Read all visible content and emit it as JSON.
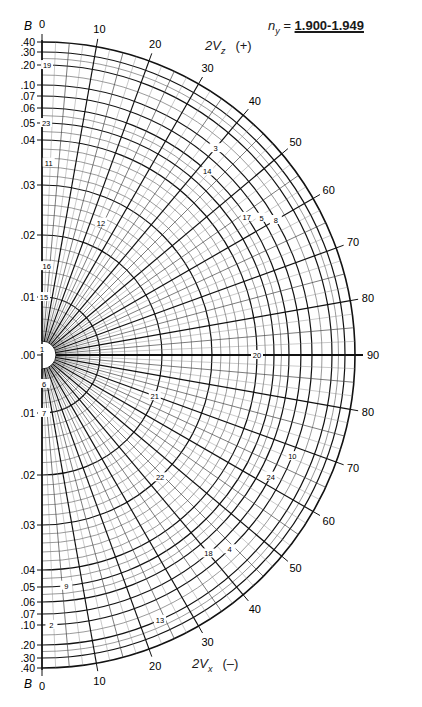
{
  "title": {
    "symbol": "n",
    "subscript": "y",
    "equals": " = ",
    "value": "1.900-1.949"
  },
  "chart_data": {
    "type": "polar",
    "upper_half": {
      "label": "2V",
      "subscript": "z",
      "sign": "(+)"
    },
    "lower_half": {
      "label": "2V",
      "subscript": "x",
      "sign": "(–)"
    },
    "radial_axis": {
      "name": "B",
      "upper_ticks": [
        ".40",
        ".30",
        ".20",
        ".10",
        ".07",
        ".06",
        ".05",
        ".04",
        ".03",
        ".02",
        ".01",
        ".00"
      ],
      "lower_ticks": [
        ".01",
        ".02",
        ".03",
        ".04",
        ".05",
        ".06",
        ".07",
        ".10",
        ".20",
        ".30",
        ".40"
      ],
      "tick_values": [
        0.4,
        0.3,
        0.2,
        0.1,
        0.07,
        0.06,
        0.05,
        0.04,
        0.03,
        0.02,
        0.01,
        0.0
      ],
      "tick_radius_px": [
        313,
        303,
        290,
        270,
        259,
        247,
        232,
        215,
        170,
        120,
        58,
        0
      ]
    },
    "angular_axis": {
      "name": "2V",
      "major_ticks": [
        0,
        10,
        20,
        30,
        40,
        50,
        60,
        70,
        80,
        90
      ],
      "minor_step": 5,
      "range": [
        0,
        90
      ]
    },
    "specimen_labels": [
      {
        "id": "1",
        "b_side": "center",
        "angle": 0,
        "b": 0.0
      },
      {
        "id": "2",
        "b_side": "lower",
        "angle": 2,
        "b": 0.1
      },
      {
        "id": "3",
        "b_side": "upper",
        "angle": 40,
        "b": 0.1
      },
      {
        "id": "4",
        "b_side": "lower",
        "angle": 44,
        "b": 0.1
      },
      {
        "id": "5",
        "b_side": "upper",
        "angle": 58,
        "b": 0.07
      },
      {
        "id": "6",
        "b_side": "lower",
        "angle": 4,
        "b": 0.005
      },
      {
        "id": "7",
        "b_side": "lower",
        "angle": 2,
        "b": 0.01
      },
      {
        "id": "8",
        "b_side": "upper",
        "angle": 60,
        "b": 0.1
      },
      {
        "id": "9",
        "b_side": "lower",
        "angle": 6,
        "b": 0.05
      },
      {
        "id": "10",
        "b_side": "lower",
        "angle": 68,
        "b": 0.1
      },
      {
        "id": "11",
        "b_side": "upper",
        "angle": 2,
        "b": 0.035
      },
      {
        "id": "12",
        "b_side": "upper",
        "angle": 24,
        "b": 0.025
      },
      {
        "id": "13",
        "b_side": "lower",
        "angle": 24,
        "b": 0.2
      },
      {
        "id": "14",
        "b_side": "upper",
        "angle": 42,
        "b": 0.06
      },
      {
        "id": "15",
        "b_side": "upper",
        "angle": 2,
        "b": 0.01
      },
      {
        "id": "16",
        "b_side": "upper",
        "angle": 3,
        "b": 0.015
      },
      {
        "id": "17",
        "b_side": "upper",
        "angle": 56,
        "b": 0.06
      },
      {
        "id": "18",
        "b_side": "lower",
        "angle": 40,
        "b": 0.07
      },
      {
        "id": "19",
        "b_side": "upper",
        "angle": 1,
        "b": 0.2
      },
      {
        "id": "20",
        "b_side": "center",
        "angle": 90,
        "b": 0.04
      },
      {
        "id": "21",
        "b_side": "lower",
        "angle": 70,
        "b": 0.02
      },
      {
        "id": "22",
        "b_side": "lower",
        "angle": 44,
        "b": 0.03
      },
      {
        "id": "23",
        "b_side": "upper",
        "angle": 1,
        "b": 0.05
      },
      {
        "id": "24",
        "b_side": "lower",
        "angle": 62,
        "b": 0.07
      }
    ],
    "grid": true,
    "legend": null
  }
}
